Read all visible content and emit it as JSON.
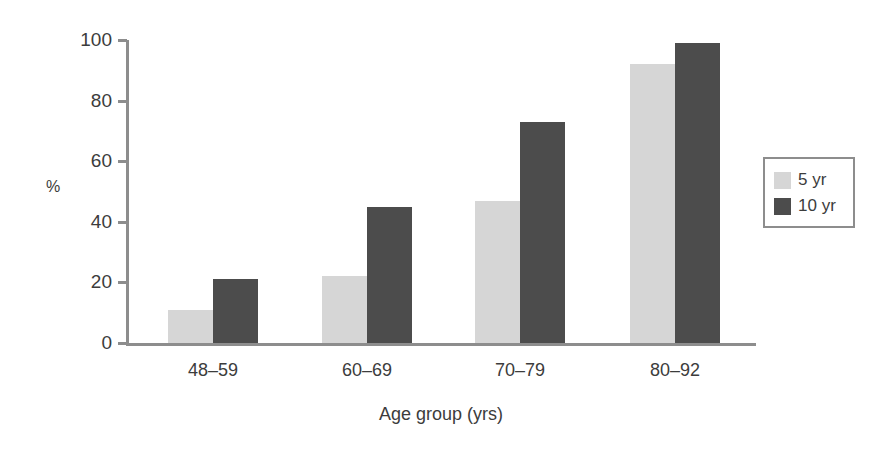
{
  "chart_data": {
    "type": "bar",
    "title": "",
    "xlabel": "Age group (yrs)",
    "ylabel": "%",
    "categories": [
      "48–59",
      "60–69",
      "70–79",
      "80–92"
    ],
    "series": [
      {
        "name": "5 yr",
        "values": [
          11,
          22,
          47,
          92
        ]
      },
      {
        "name": "10 yr",
        "values": [
          21,
          45,
          73,
          99
        ]
      }
    ],
    "ylim": [
      0,
      100
    ],
    "yticks": [
      0,
      20,
      40,
      60,
      80,
      100
    ],
    "ytick_labels": [
      "0",
      "20",
      "40",
      "60",
      "80",
      "100"
    ],
    "grid": false,
    "legend_position": "right",
    "colors": {
      "series_5yr": "#d6d6d6",
      "series_10yr": "#4c4c4c",
      "axis": "#8d8d8d",
      "text": "#3c3c3c",
      "background": "#ffffff"
    }
  },
  "legend": {
    "entries": [
      {
        "label": "5 yr",
        "color": "#d6d6d6"
      },
      {
        "label": "10 yr",
        "color": "#4c4c4c"
      }
    ]
  }
}
